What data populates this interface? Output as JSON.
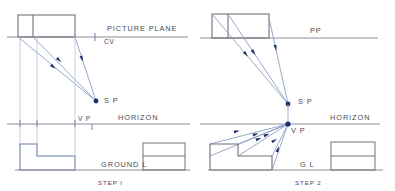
{
  "figure": {
    "title_hidden": "",
    "background_color": "#ffffff",
    "panels": [
      {
        "id": "step-1",
        "caption": "STEP I",
        "caption_pos": {
          "x": 98,
          "y": 185
        },
        "labels": [
          {
            "name": "picture-plane-label",
            "text": "PICTURE PLANE",
            "x": 107,
            "y": 31
          },
          {
            "name": "cv-label",
            "text": "CV",
            "x": 104,
            "y": 44
          },
          {
            "name": "sp-label",
            "text": "S P",
            "x": 104,
            "y": 103
          },
          {
            "name": "vp-label",
            "text": "V P",
            "x": 78,
            "y": 121
          },
          {
            "name": "horizon-label",
            "text": "HORIZON",
            "x": 118,
            "y": 120
          },
          {
            "name": "ground-line-label",
            "text": "GROUND L",
            "x": 101,
            "y": 167
          }
        ],
        "lines": {
          "picture_plane": {
            "x1": 7,
            "y1": 37,
            "x2": 188,
            "y2": 37,
            "color": "#8c8c99"
          },
          "horizon": {
            "x1": 7,
            "y1": 124,
            "x2": 190,
            "y2": 124,
            "color": "#8c8c99"
          },
          "ground": {
            "x1": 15,
            "y1": 170,
            "x2": 190,
            "y2": 170,
            "color": "#8c8c99"
          }
        },
        "plan_box": {
          "x": 18,
          "y": 15,
          "w": 57,
          "h": 22,
          "divider_x": 33,
          "color": "#6f6f78"
        },
        "elevation_shape": {
          "color": "#6a7fa8",
          "points": "20,144 37,144 37,156 75,156 75,170 20,170"
        },
        "side_box": {
          "x": 143,
          "y": 143,
          "w": 42,
          "h": 27,
          "divider_y": 156,
          "color": "#6f6f78"
        },
        "station_point": {
          "x": 96,
          "y": 101,
          "color": "#1f2d6b"
        },
        "vanishing_point": {
          "x": 92,
          "y": 124,
          "color": "#1f2d6b"
        },
        "cv_tick": {
          "x": 95,
          "y": 37
        },
        "projector_x": [
          20,
          37,
          75
        ],
        "rays": [
          {
            "from": [
              18,
              37
            ],
            "to": [
              96,
              101
            ],
            "arrow_t": 0.42
          },
          {
            "from": [
              33,
              37
            ],
            "to": [
              96,
              101
            ],
            "arrow_t": 0.38
          },
          {
            "from": [
              75,
              37
            ],
            "to": [
              96,
              101
            ],
            "arrow_t": 0.3
          }
        ]
      },
      {
        "id": "step-2",
        "caption": "STEP 2",
        "caption_pos": {
          "x": 295,
          "y": 185
        },
        "labels": [
          {
            "name": "picture-plane-label",
            "text": "PP",
            "x": 310,
            "y": 33
          },
          {
            "name": "sp-label",
            "text": "S P",
            "x": 298,
            "y": 104
          },
          {
            "name": "horizon-label",
            "text": "HORIZON",
            "x": 330,
            "y": 120
          },
          {
            "name": "vp-label",
            "text": "V P",
            "x": 291,
            "y": 133
          },
          {
            "name": "ground-line-label",
            "text": "G L",
            "x": 300,
            "y": 167
          }
        ],
        "lines": {
          "picture_plane": {
            "x1": 200,
            "y1": 38,
            "x2": 378,
            "y2": 38,
            "color": "#8c8c99"
          },
          "horizon": {
            "x1": 200,
            "y1": 124,
            "x2": 380,
            "y2": 124,
            "color": "#8c8c99"
          },
          "ground": {
            "x1": 208,
            "y1": 170,
            "x2": 383,
            "y2": 170,
            "color": "#8c8c99"
          }
        },
        "plan_box": {
          "x": 212,
          "y": 14,
          "w": 57,
          "h": 24,
          "divider_x": 228,
          "color": "#6f6f78"
        },
        "elevation_shape": {
          "color": "#6f6f78",
          "points": "210,144 238,144 238,156 272,156 272,170 210,170"
        },
        "side_box": {
          "x": 331,
          "y": 142,
          "w": 44,
          "h": 28,
          "divider_y": 156,
          "color": "#6f6f78"
        },
        "station_point": {
          "x": 288,
          "y": 104,
          "color": "#1f2d6b"
        },
        "vanishing_point": {
          "x": 288,
          "y": 124,
          "color": "#1f2d6b"
        },
        "rays_to_sp": [
          {
            "from": [
              212,
              38
            ],
            "to": [
              288,
              104
            ],
            "arrow_t": 0.45
          },
          {
            "from": [
              228,
              38
            ],
            "to": [
              288,
              104
            ],
            "arrow_t": 0.4
          },
          {
            "from": [
              269,
              38
            ],
            "to": [
              288,
              104
            ],
            "arrow_t": 0.32
          }
        ],
        "rays_to_vp": [
          {
            "from": [
              210,
              144
            ],
            "to": [
              288,
              124
            ],
            "arrow_t": 0.55
          },
          {
            "from": [
              238,
              144
            ],
            "to": [
              288,
              124
            ],
            "arrow_t": 0.5
          },
          {
            "from": [
              238,
              156
            ],
            "to": [
              288,
              124
            ],
            "arrow_t": 0.5
          },
          {
            "from": [
              272,
              156
            ],
            "to": [
              288,
              124
            ],
            "arrow_t": 0.4
          },
          {
            "from": [
              272,
              170
            ],
            "to": [
              288,
              124
            ],
            "arrow_t": 0.45
          },
          {
            "from": [
              210,
              156
            ],
            "to": [
              288,
              124
            ],
            "arrow_t": 0.58
          }
        ]
      }
    ],
    "colors": {
      "line_gray": "#8c8c99",
      "object_gray": "#6f6f78",
      "object_blue": "#6a7fa8",
      "ray_blue": "#8c9ec4",
      "point_navy": "#1f2d6b",
      "text": "#4a4a55"
    }
  }
}
